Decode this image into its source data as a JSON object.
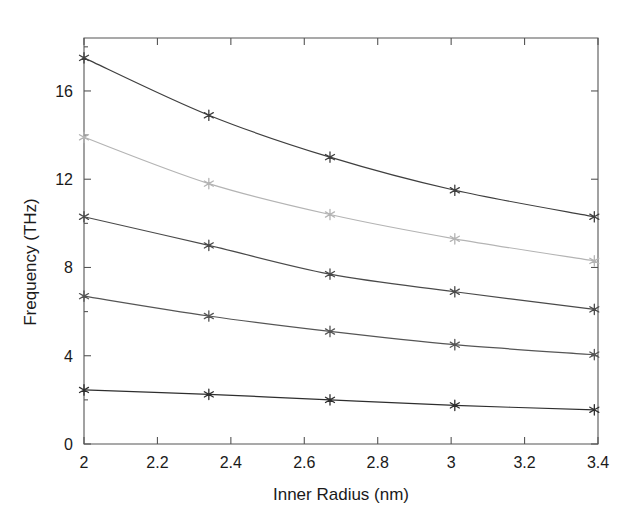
{
  "chart_data": {
    "type": "line",
    "title": "",
    "xlabel": "Inner Radius (nm)",
    "ylabel": "Frequency (THz)",
    "xlim": [
      2,
      3.4
    ],
    "ylim": [
      0,
      18.4
    ],
    "grid": false,
    "legend": "none",
    "marker": "star",
    "xticks": [
      2,
      2.2,
      2.4,
      2.6,
      2.8,
      3,
      3.2,
      3.4
    ],
    "xticklabels": [
      "2",
      "2.2",
      "2.4",
      "2.6",
      "2.8",
      "3",
      "3.2",
      "3.4"
    ],
    "yticks": [
      0,
      4,
      8,
      12,
      16
    ],
    "yticklabels": [
      "0",
      "4",
      "8",
      "12",
      "16"
    ],
    "x": [
      2.0,
      2.34,
      2.67,
      3.01,
      3.39
    ],
    "series": [
      {
        "name": "series-1",
        "color": "#3f3f3f",
        "values": [
          17.5,
          14.9,
          13.0,
          11.5,
          10.3
        ]
      },
      {
        "name": "series-2",
        "color": "#b4b4b4",
        "values": [
          13.9,
          11.8,
          10.4,
          9.3,
          8.3
        ]
      },
      {
        "name": "series-3",
        "color": "#4a4a4a",
        "values": [
          10.3,
          9.0,
          7.7,
          6.9,
          6.1
        ]
      },
      {
        "name": "series-4",
        "color": "#555555",
        "values": [
          6.7,
          5.8,
          5.1,
          4.5,
          4.05
        ]
      },
      {
        "name": "series-5",
        "color": "#2e2e2e",
        "values": [
          2.45,
          2.25,
          2.0,
          1.75,
          1.55
        ]
      }
    ]
  },
  "axes": {
    "x_label": "Inner Radius (nm)",
    "y_label": "Frequency (THz)"
  }
}
